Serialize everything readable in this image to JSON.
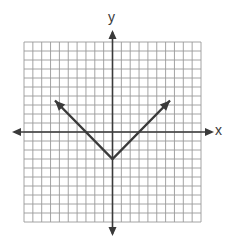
{
  "chart_data": {
    "type": "line",
    "title": "",
    "xlabel": "x",
    "ylabel": "y",
    "function": "y = |x| - 3",
    "grid": true,
    "grid_cells": {
      "x": 20,
      "y": 20
    },
    "xlim": [
      -10,
      10
    ],
    "ylim": [
      -10,
      10
    ],
    "series": [
      {
        "name": "absolute value graph",
        "points": [
          [
            -6.5,
            3.5
          ],
          [
            0,
            -3
          ],
          [
            6.5,
            3.5
          ]
        ],
        "arrows_at_ends": true
      }
    ],
    "vertex": [
      0,
      -3
    ],
    "x_intercepts": [
      -3,
      3
    ],
    "y_intercept": -3
  },
  "labels": {
    "x_axis": "x",
    "y_axis": "y"
  },
  "colors": {
    "grid": "#9a9a9a",
    "axes": "#3a3a3a",
    "line": "#3a3a3a",
    "background": "#ffffff"
  }
}
